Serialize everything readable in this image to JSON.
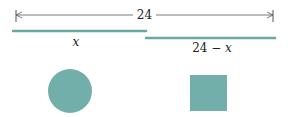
{
  "diagram": {
    "total_length_label": "24",
    "segment_left_label": "x",
    "segment_right_label_num": "24 − ",
    "segment_right_label_var": "x",
    "colors": {
      "segment": "#6aa8a4",
      "shape_fill": "#72aeaa",
      "dimension_line": "#555555"
    },
    "shapes": [
      {
        "type": "circle",
        "name": "circle"
      },
      {
        "type": "square",
        "name": "square"
      }
    ]
  }
}
